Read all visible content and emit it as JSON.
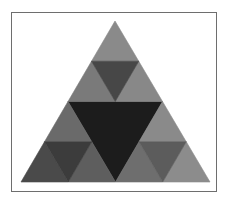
{
  "figure": {
    "frame": {
      "border_color": "#6e6e6e",
      "background": "#ffffff"
    },
    "triangles": [
      {
        "name": "center-inverted",
        "points": "68,101.5 162.5,101.5 115.5,182",
        "fill": "#1c1c1c"
      },
      {
        "name": "top-apex",
        "points": "115,21 91.5,61.25 138.75,61.25",
        "fill": "#8a8a8a"
      },
      {
        "name": "top-left",
        "points": "91.5,61.25 68,101.5 115.25,101.5",
        "fill": "#7a7a7a"
      },
      {
        "name": "top-right",
        "points": "138.75,61.25 115.25,101.5 162.5,101.5",
        "fill": "#888888"
      },
      {
        "name": "top-center",
        "points": "91.5,61.25 138.75,61.25 115.25,101.5",
        "fill": "#474747"
      },
      {
        "name": "left-top",
        "points": "68,101.5 44.5,141.75 91.75,141.75",
        "fill": "#6a6a6a"
      },
      {
        "name": "left-bottom-left",
        "points": "44.5,141.75 21,182 68.25,182",
        "fill": "#4a4a4a"
      },
      {
        "name": "left-bottom-right",
        "points": "91.75,141.75 68.25,182 115.5,182",
        "fill": "#5e5e5e"
      },
      {
        "name": "left-center",
        "points": "44.5,141.75 91.75,141.75 68.25,182",
        "fill": "#3c3c3c"
      },
      {
        "name": "right-top",
        "points": "162.5,101.5 139,141.75 186.25,141.75",
        "fill": "#8a8a8a"
      },
      {
        "name": "right-bottom-left",
        "points": "139,141.75 115.5,182 162.75,182",
        "fill": "#6e6e6e"
      },
      {
        "name": "right-bottom-right",
        "points": "186.25,141.75 162.75,182 210,182",
        "fill": "#8c8c8c"
      },
      {
        "name": "right-center",
        "points": "139,141.75 186.25,141.75 162.75,182",
        "fill": "#5c5c5c"
      }
    ]
  }
}
